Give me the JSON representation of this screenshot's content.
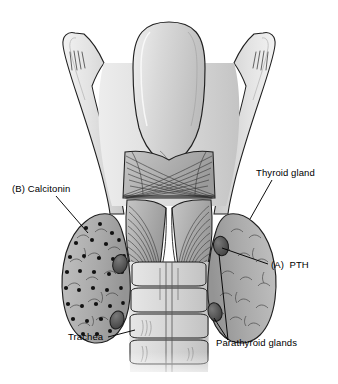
{
  "figure": {
    "background_color": "#ffffff",
    "ink_color": "#000000",
    "style": "grayscale line-and-wash medical illustration"
  },
  "labels": {
    "calcitonin": "(B) Calcitonin",
    "thyroid_gland": "Thyroid gland",
    "pth": "(A)  PTH",
    "trachea": "Trachea",
    "parathyroid_glands": "Parathyroid glands"
  },
  "structures": [
    {
      "name": "hyoid-greater-horn-left",
      "fill": "#e8e8e8"
    },
    {
      "name": "hyoid-greater-horn-right",
      "fill": "#e8e8e8"
    },
    {
      "name": "epiglottis",
      "fill": "#d8d8d8"
    },
    {
      "name": "thyroid-cartilage",
      "fill": "#dcdcdc"
    },
    {
      "name": "cricothyroid-muscle",
      "fill": "#b4b4b4"
    },
    {
      "name": "cricoid-cartilage",
      "fill": "#b8b8b8"
    },
    {
      "name": "trachea",
      "fill": "#dadada"
    },
    {
      "name": "thyroid-lobe-left",
      "fill": "#b0b0b0"
    },
    {
      "name": "thyroid-lobe-right",
      "fill": "#b0b0b0"
    },
    {
      "name": "parathyroid-gland",
      "fill": "#5a5a5a"
    },
    {
      "name": "c-cell-dot",
      "fill": "#111111"
    }
  ],
  "palette": {
    "outline": "#1a1a1a",
    "cartilage_light": "#e8e8e8",
    "cartilage_mid": "#d2d2d2",
    "muscle": "#b4b4b4",
    "gland": "#b0b0b0",
    "parathyroid": "#5a5a5a",
    "dot": "#111111"
  }
}
